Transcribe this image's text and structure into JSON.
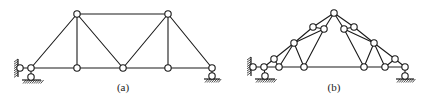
{
  "figure": {
    "colors": {
      "line": "#1a1a1a",
      "background": "#ffffff",
      "node_fill": "#ffffff"
    },
    "node_radius": 3.2,
    "panels": [
      {
        "id": "a",
        "label": "(a)",
        "label_pos": [
          123,
          91
        ],
        "nodes": {
          "L0": [
            20,
            68
          ],
          "L1": [
            31,
            68
          ],
          "L2": [
            77,
            68
          ],
          "L3": [
            123,
            68
          ],
          "L4": [
            168,
            68
          ],
          "L5": [
            212,
            68
          ],
          "U1": [
            77,
            14
          ],
          "U2": [
            168,
            14
          ],
          "P1": [
            31,
            77
          ],
          "P2": [
            212,
            76
          ]
        },
        "members": [
          [
            "L0",
            "L1"
          ],
          [
            "L1",
            "L2"
          ],
          [
            "L2",
            "L3"
          ],
          [
            "L3",
            "L4"
          ],
          [
            "L4",
            "L5"
          ],
          [
            "U1",
            "U2"
          ],
          [
            "L1",
            "U1"
          ],
          [
            "U1",
            "L2"
          ],
          [
            "U1",
            "L3"
          ],
          [
            "L3",
            "U2"
          ],
          [
            "U2",
            "L4"
          ],
          [
            "U2",
            "L5"
          ],
          [
            "L1",
            "P1"
          ],
          [
            "L5",
            "P2"
          ]
        ],
        "supports": [
          {
            "type": "wall",
            "x": 16,
            "y1": 59,
            "y2": 77
          },
          {
            "type": "ground",
            "x1": 22,
            "x2": 41,
            "y": 80
          },
          {
            "type": "ground",
            "x1": 204,
            "x2": 220,
            "y": 79
          }
        ]
      },
      {
        "id": "b",
        "label": "(b)",
        "label_pos": [
          334,
          91
        ],
        "nodes": {
          "S0": [
            253,
            67
          ],
          "A": [
            264,
            67
          ],
          "B": [
            274,
            59
          ],
          "C": [
            279,
            67
          ],
          "D": [
            294,
            43
          ],
          "E": [
            304,
            67
          ],
          "F": [
            313,
            27
          ],
          "G": [
            324,
            29
          ],
          "T": [
            334,
            13
          ],
          "G2": [
            344,
            29
          ],
          "F2": [
            354,
            27
          ],
          "D2": [
            374,
            43
          ],
          "E2": [
            364,
            67
          ],
          "C2": [
            385,
            67
          ],
          "B2": [
            395,
            59
          ],
          "A2": [
            405,
            67
          ],
          "P1": [
            265,
            76
          ],
          "P2": [
            405,
            76
          ]
        },
        "members": [
          [
            "S0",
            "A"
          ],
          [
            "A",
            "C"
          ],
          [
            "C",
            "E"
          ],
          [
            "E",
            "E2"
          ],
          [
            "E2",
            "C2"
          ],
          [
            "C2",
            "A2"
          ],
          [
            "A",
            "B"
          ],
          [
            "B",
            "D"
          ],
          [
            "D",
            "F"
          ],
          [
            "F",
            "T"
          ],
          [
            "T",
            "F2"
          ],
          [
            "F2",
            "D2"
          ],
          [
            "D2",
            "B2"
          ],
          [
            "B2",
            "A2"
          ],
          [
            "B",
            "C"
          ],
          [
            "C",
            "D"
          ],
          [
            "D",
            "E"
          ],
          [
            "D",
            "G"
          ],
          [
            "F",
            "G"
          ],
          [
            "G",
            "T"
          ],
          [
            "G",
            "E"
          ],
          [
            "B2",
            "C2"
          ],
          [
            "C2",
            "D2"
          ],
          [
            "D2",
            "E2"
          ],
          [
            "D2",
            "G2"
          ],
          [
            "F2",
            "G2"
          ],
          [
            "G2",
            "T"
          ],
          [
            "G2",
            "E2"
          ],
          [
            "A",
            "P1"
          ],
          [
            "A2",
            "P2"
          ]
        ],
        "supports": [
          {
            "type": "wall",
            "x": 249,
            "y1": 57,
            "y2": 76
          },
          {
            "type": "ground",
            "x1": 255,
            "x2": 275,
            "y": 79
          },
          {
            "type": "ground",
            "x1": 396,
            "x2": 414,
            "y": 79
          }
        ]
      }
    ]
  }
}
